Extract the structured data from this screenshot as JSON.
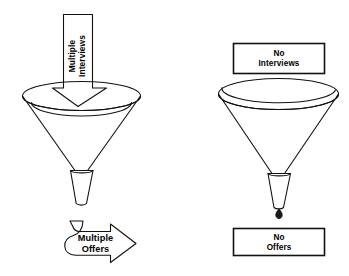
{
  "figure": {
    "background_color": "#ffffff",
    "line_color": "#111111",
    "text_color": "#000000"
  },
  "left_panel": {
    "name": "successful-funnel",
    "inflow_arrow": {
      "icon": "down-block-arrow-icon",
      "line1": "Multiple",
      "line2": "Interviews",
      "rotation": "vertical-bottom-to-top"
    },
    "funnel": {
      "icon": "funnel-icon",
      "label": "funnel"
    },
    "outflow_arrow": {
      "icon": "curved-right-arrow-icon",
      "line1": "Multiple",
      "line2": "Offers"
    }
  },
  "right_panel": {
    "name": "unsuccessful-funnel",
    "inflow_box": {
      "icon": "rectangle-box-icon",
      "line1": "No",
      "line2": "Interviews"
    },
    "funnel": {
      "icon": "funnel-icon",
      "label": "funnel"
    },
    "drip": {
      "icon": "droplet-icon",
      "label": "single drop"
    },
    "outflow_box": {
      "icon": "rectangle-box-icon",
      "line1": "No",
      "line2": "Offers"
    }
  }
}
